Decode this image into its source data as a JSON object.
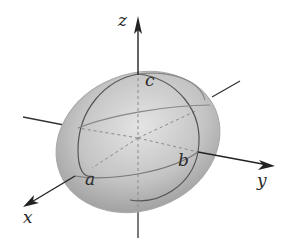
{
  "diagram": {
    "type": "ellipsoid",
    "axes": {
      "x_label": "x",
      "y_label": "y",
      "z_label": "z"
    },
    "intercepts": {
      "a_label": "a",
      "b_label": "b",
      "c_label": "c"
    },
    "colors": {
      "surface_light": "#d6d6d6",
      "surface_dark": "#9a9a9a",
      "line": "#3a3a3a",
      "hidden_line": "#8a8a8a"
    }
  }
}
